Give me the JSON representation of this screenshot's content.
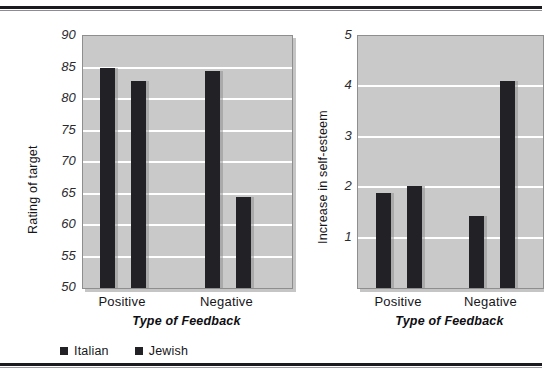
{
  "figure": {
    "legend": {
      "items": [
        {
          "label": "Italian",
          "color": "#222226"
        },
        {
          "label": "Jewish",
          "color": "#222226"
        }
      ]
    }
  },
  "chart_data": [
    {
      "type": "bar",
      "panel": "left",
      "title": "",
      "xlabel": "Type of Feedback",
      "ylabel": "Rating of target",
      "categories": [
        "Positive",
        "Negative"
      ],
      "series": [
        {
          "name": "Italian",
          "values": [
            85.0,
            84.5
          ],
          "color": "#222226"
        },
        {
          "name": "Jewish",
          "values": [
            82.8,
            64.4
          ],
          "color": "#222226"
        }
      ],
      "ylim": [
        50,
        90
      ],
      "yticks": [
        50,
        55,
        60,
        65,
        70,
        75,
        80,
        85,
        90
      ],
      "ytick_labels": [
        "50",
        "55",
        "60",
        "65",
        "70",
        "75",
        "80",
        "85",
        "90"
      ],
      "grid": true,
      "gridline_color": "#ffffff",
      "plot_background": "#c9c9c9",
      "legend_position": "bottom-left"
    },
    {
      "type": "bar",
      "panel": "right",
      "title": "",
      "xlabel": "Type of Feedback",
      "ylabel": "Increase in self-esteem",
      "categories": [
        "Positive",
        "Negative"
      ],
      "series": [
        {
          "name": "Italian",
          "values": [
            1.88,
            1.43
          ],
          "color": "#222226"
        },
        {
          "name": "Jewish",
          "values": [
            2.03,
            4.1
          ],
          "color": "#222226"
        }
      ],
      "ylim": [
        0,
        5
      ],
      "yticks": [
        1,
        2,
        3,
        4,
        5
      ],
      "ytick_labels": [
        "1",
        "2",
        "3",
        "4",
        "5"
      ],
      "grid": true,
      "gridline_color": "#ffffff",
      "plot_background": "#c9c9c9",
      "legend_position": "none"
    }
  ]
}
